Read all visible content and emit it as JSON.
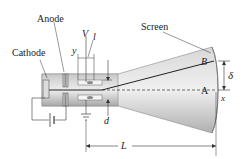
{
  "diagram": {
    "type": "cathode-ray-tube",
    "labels": {
      "cathode": "Cathode",
      "anode": "Anode",
      "screen": "Screen",
      "voltage": "V",
      "plate_length": "l",
      "y": "y",
      "d": "d",
      "L": "L",
      "B": "B",
      "A": "A",
      "delta": "δ",
      "x": "x"
    },
    "colors": {
      "tube_light": "#e6e6e6",
      "tube_dark": "#9a9a9a",
      "line": "#333333",
      "beam": "#222222"
    }
  }
}
